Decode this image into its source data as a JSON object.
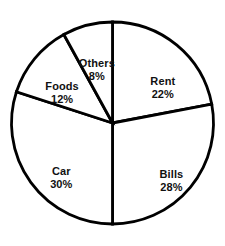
{
  "chart_data": {
    "type": "pie",
    "title": "",
    "subtitle": "",
    "xlabel": "",
    "ylabel": "",
    "legend": "none",
    "grid": false,
    "start_angle_deg": 0,
    "direction": "clockwise",
    "units": "percent",
    "total": 100,
    "categories": [
      "Rent",
      "Bills",
      "Car",
      "Foods",
      "Others"
    ],
    "values": [
      22,
      28,
      30,
      12,
      8
    ],
    "slices": [
      {
        "name": "Rent",
        "value": 22,
        "value_label": "22%",
        "start_deg": 0,
        "end_deg": 79.2,
        "fill": "#ffffff",
        "stroke": "#000000",
        "label_x_pct": 47.0,
        "label_y_pct": 28.5
      },
      {
        "name": "Bills",
        "value": 28,
        "value_label": "28%",
        "start_deg": 79.2,
        "end_deg": 180.0,
        "fill": "#ffffff",
        "stroke": "#000000",
        "label_x_pct": 50.5,
        "label_y_pct": 72.5
      },
      {
        "name": "Car",
        "value": 30,
        "value_label": "30%",
        "start_deg": 180.0,
        "end_deg": 288.0,
        "fill": "#ffffff",
        "stroke": "#000000",
        "label_x_pct": -18.0,
        "label_y_pct": 72.0
      },
      {
        "name": "Foods",
        "value": 12,
        "value_label": "12%",
        "start_deg": 288.0,
        "end_deg": 331.2,
        "fill": "#ffffff",
        "stroke": "#000000",
        "label_x_pct": -22.5,
        "label_y_pct": 21.0
      },
      {
        "name": "Others",
        "value": 8,
        "value_label": "8%",
        "start_deg": 331.2,
        "end_deg": 360.0,
        "fill": "#ffffff",
        "stroke": "#000000",
        "label_x_pct": -5.0,
        "label_y_pct": 6.0
      }
    ],
    "geometry": {
      "center_x": 112.5,
      "center_y": 123.0,
      "radius": 101.0,
      "stroke_width": 2.8,
      "background": "#ffffff"
    }
  }
}
